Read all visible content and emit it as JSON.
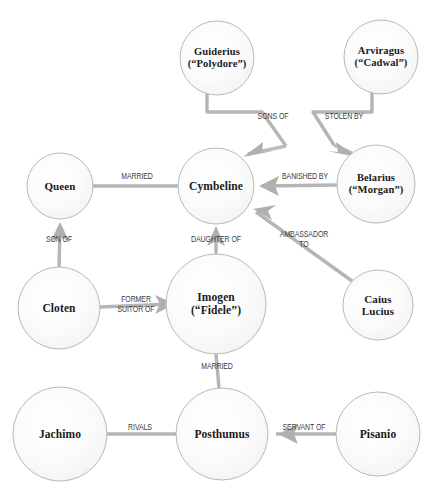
{
  "diagram": {
    "type": "network-graph",
    "background_color": "#ffffff",
    "node_fill": "#fbfbfb",
    "node_stroke": "#b9b9b9",
    "edge_color": "#b3b3b3",
    "node_text_color": "#1a1a1a",
    "edge_text_color": "#3c3c3c",
    "nodes": [
      {
        "id": "guiderius",
        "label": "Guiderius\n(“Polydore”)",
        "cx": 217,
        "cy": 58,
        "r": 37,
        "font_size": 10.5
      },
      {
        "id": "arviragus",
        "label": "Arviragus\n(“Cadwal”)",
        "cx": 381,
        "cy": 57,
        "r": 37,
        "font_size": 10.5
      },
      {
        "id": "queen",
        "label": "Queen",
        "cx": 60,
        "cy": 186,
        "r": 33,
        "font_size": 11
      },
      {
        "id": "cymbeline",
        "label": "Cymbeline",
        "cx": 216,
        "cy": 186,
        "r": 38,
        "font_size": 11.5
      },
      {
        "id": "belarius",
        "label": "Belarius\n(“Morgan”)",
        "cx": 376,
        "cy": 184,
        "r": 39,
        "font_size": 10.5
      },
      {
        "id": "cloten",
        "label": "Cloten",
        "cx": 59,
        "cy": 308,
        "r": 41,
        "font_size": 11.5
      },
      {
        "id": "imogen",
        "label": "Imogen\n(“Fidele”)",
        "cx": 216,
        "cy": 304,
        "r": 50,
        "font_size": 11.5
      },
      {
        "id": "caius-lucius",
        "label": "Caius\nLucius",
        "cx": 378,
        "cy": 305,
        "r": 35,
        "font_size": 11
      },
      {
        "id": "jachimo",
        "label": "Jachimo",
        "cx": 60,
        "cy": 434,
        "r": 47,
        "font_size": 11.5
      },
      {
        "id": "posthumus",
        "label": "Posthumus",
        "cx": 222,
        "cy": 434,
        "r": 46,
        "font_size": 11.5
      },
      {
        "id": "pisanio",
        "label": "Pisanio",
        "cx": 378,
        "cy": 434,
        "r": 42,
        "font_size": 11.5
      }
    ],
    "edges": [
      {
        "id": "sons-of",
        "label": "SONS OF",
        "from": "guiderius",
        "to": "cymbeline",
        "label_x": 273,
        "label_y": 120,
        "font_size": 8.5
      },
      {
        "id": "stolen-by",
        "label": "STOLEN BY",
        "from": "arviragus",
        "to": "belarius",
        "label_x": 344,
        "label_y": 120,
        "font_size": 8.5
      },
      {
        "id": "married-queen",
        "label": "MARRIED",
        "from": "queen",
        "to": "cymbeline",
        "label_x": 137,
        "label_y": 180,
        "font_size": 8.5
      },
      {
        "id": "banished-by",
        "label": "BANISHED BY",
        "from": "belarius",
        "to": "cymbeline",
        "label_x": 305,
        "label_y": 180,
        "font_size": 8.5
      },
      {
        "id": "son-of",
        "label": "SON OF",
        "from": "cloten",
        "to": "queen",
        "label_x": 59,
        "label_y": 243,
        "font_size": 8.5
      },
      {
        "id": "daughter-of",
        "label": "DAUGHTER OF",
        "from": "imogen",
        "to": "cymbeline",
        "label_x": 216,
        "label_y": 243,
        "font_size": 8.5
      },
      {
        "id": "ambassador-to",
        "label": "AMBASSADOR\nTO",
        "from": "caius-lucius",
        "to": "cymbeline",
        "label_x": 304,
        "label_y": 238,
        "font_size": 8.5
      },
      {
        "id": "former-suitor-of",
        "label": "FORMER\nSUITOR OF",
        "from": "cloten",
        "to": "imogen",
        "label_x": 136,
        "label_y": 303,
        "font_size": 8.5
      },
      {
        "id": "married-imogen",
        "label": "MARRIED",
        "from": "imogen",
        "to": "posthumus",
        "label_x": 217,
        "label_y": 370,
        "font_size": 8.5
      },
      {
        "id": "rivals",
        "label": "RIVALS",
        "from": "jachimo",
        "to": "posthumus",
        "label_x": 140,
        "label_y": 431,
        "font_size": 8.5
      },
      {
        "id": "servant-of",
        "label": "SERVANT OF",
        "from": "pisanio",
        "to": "posthumus",
        "label_x": 304,
        "label_y": 431,
        "font_size": 8.5
      }
    ]
  }
}
